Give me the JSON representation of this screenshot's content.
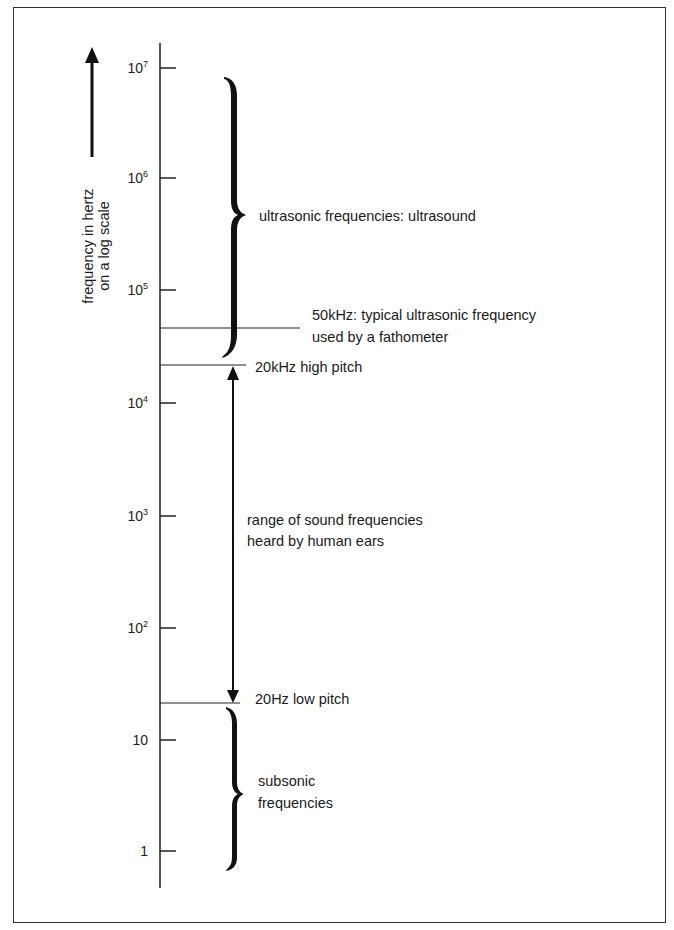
{
  "axis": {
    "label_line1": "frequency in hertz",
    "label_line2": "on a log scale",
    "direction_arrow": "arrow-up-icon",
    "ticks": [
      {
        "base": "10",
        "exp": "7",
        "y": 68
      },
      {
        "base": "10",
        "exp": "6",
        "y": 178
      },
      {
        "base": "10",
        "exp": "5",
        "y": 290
      },
      {
        "base": "10",
        "exp": "4",
        "y": 403
      },
      {
        "base": "10",
        "exp": "3",
        "y": 516
      },
      {
        "base": "10",
        "exp": "2",
        "y": 628
      },
      {
        "base": "10",
        "exp": "",
        "y": 740
      },
      {
        "base": "1",
        "exp": "",
        "y": 851
      }
    ]
  },
  "annotations": {
    "ultrasonic": "ultrasonic frequencies:  ultrasound",
    "fathometer_line1": "50kHz: typical ultrasonic frequency",
    "fathometer_line2": "used by a fathometer",
    "high_pitch": "20kHz  high pitch",
    "human_line1": "range of sound frequencies",
    "human_line2": "heard by human ears",
    "low_pitch": "20Hz  low pitch",
    "subsonic_line1": "subsonic",
    "subsonic_line2": "frequencies"
  }
}
